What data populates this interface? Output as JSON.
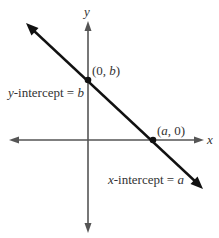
{
  "diagram": {
    "axes": {
      "x_label": "x",
      "y_label": "y"
    },
    "points": [
      {
        "name": "y-intercept-point",
        "label_open": "(0, ",
        "label_var": "b",
        "label_close": ")",
        "coords": "(0, b)"
      },
      {
        "name": "x-intercept-point",
        "label_open": "(",
        "label_var": "a",
        "label_close": ", 0)",
        "coords": "(a, 0)"
      }
    ],
    "annotations": {
      "y_intercept": {
        "var": "y",
        "text": "-intercept = ",
        "value": "b"
      },
      "x_intercept": {
        "var": "x",
        "text": "-intercept = ",
        "value": "a"
      }
    },
    "colors": {
      "axis": "#555555",
      "line": "#111111",
      "text": "#333333",
      "background": "#ffffff"
    }
  }
}
